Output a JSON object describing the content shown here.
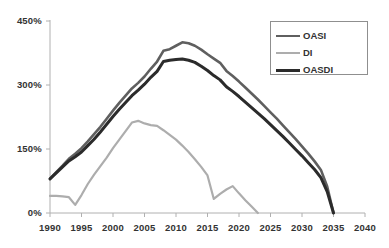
{
  "chart_data": {
    "type": "line",
    "title": "",
    "subtitle": "",
    "xlabel": "",
    "ylabel": "",
    "xlim": [
      1990,
      2040
    ],
    "ylim": [
      0,
      450
    ],
    "grid": false,
    "legend_position": "top-right",
    "y_ticks": [
      "0%",
      "150%",
      "300%",
      "450%"
    ],
    "y_tick_values": [
      0,
      150,
      300,
      450
    ],
    "x_ticks": [
      "1990",
      "1995",
      "2000",
      "2005",
      "2010",
      "2015",
      "2020",
      "2025",
      "2030",
      "2035",
      "2040"
    ],
    "x_tick_values": [
      1990,
      1995,
      2000,
      2005,
      2010,
      2015,
      2020,
      2025,
      2030,
      2035,
      2040
    ],
    "series": [
      {
        "name": "OASI",
        "color": "#5f5f5f",
        "width": 2.6,
        "x": [
          1990,
          1991,
          1992,
          1993,
          1994,
          1995,
          1996,
          1997,
          1998,
          1999,
          2000,
          2001,
          2002,
          2003,
          2004,
          2005,
          2006,
          2007,
          2008,
          2009,
          2010,
          2011,
          2012,
          2013,
          2014,
          2015,
          2016,
          2017,
          2018,
          2019,
          2020,
          2021,
          2022,
          2023,
          2024,
          2025,
          2026,
          2027,
          2028,
          2029,
          2030,
          2031,
          2032,
          2033,
          2034,
          2035
        ],
        "y": [
          80,
          96,
          111,
          127,
          139,
          152,
          168,
          185,
          202,
          221,
          240,
          258,
          275,
          292,
          305,
          320,
          338,
          355,
          380,
          384,
          392,
          400,
          398,
          392,
          383,
          372,
          362,
          352,
          333,
          321,
          308,
          294,
          280,
          266,
          251,
          236,
          221,
          205,
          189,
          173,
          156,
          139,
          121,
          101,
          62,
          0
        ]
      },
      {
        "name": "DI",
        "color": "#adadad",
        "width": 2.2,
        "x": [
          1990,
          1991,
          1992,
          1993,
          1994,
          1995,
          1996,
          1997,
          1998,
          1999,
          2000,
          2001,
          2002,
          2003,
          2004,
          2005,
          2006,
          2007,
          2008,
          2009,
          2010,
          2011,
          2012,
          2013,
          2014,
          2015,
          2016,
          2017,
          2018,
          2019,
          2020,
          2021,
          2022,
          2023
        ],
        "y": [
          40,
          40,
          39,
          37,
          19,
          42,
          68,
          90,
          110,
          130,
          152,
          172,
          192,
          212,
          216,
          210,
          206,
          204,
          194,
          183,
          172,
          158,
          143,
          126,
          108,
          88,
          33,
          45,
          55,
          63,
          46,
          30,
          15,
          0
        ]
      },
      {
        "name": "OASDI",
        "color": "#2b2b2b",
        "width": 3.0,
        "x": [
          1990,
          1991,
          1992,
          1993,
          1994,
          1995,
          1996,
          1997,
          1998,
          1999,
          2000,
          2001,
          2002,
          2003,
          2004,
          2005,
          2006,
          2007,
          2008,
          2009,
          2010,
          2011,
          2012,
          2013,
          2014,
          2015,
          2016,
          2017,
          2018,
          2019,
          2020,
          2021,
          2022,
          2023,
          2024,
          2025,
          2026,
          2027,
          2028,
          2029,
          2030,
          2031,
          2032,
          2033,
          2034,
          2035
        ],
        "y": [
          80,
          94,
          108,
          122,
          132,
          143,
          158,
          173,
          190,
          208,
          226,
          243,
          259,
          275,
          288,
          302,
          318,
          332,
          355,
          358,
          360,
          361,
          358,
          353,
          344,
          334,
          322,
          312,
          296,
          285,
          273,
          260,
          247,
          234,
          221,
          207,
          193,
          179,
          164,
          149,
          134,
          118,
          102,
          83,
          50,
          0
        ]
      }
    ]
  },
  "legend": {
    "items": [
      {
        "label": "OASI"
      },
      {
        "label": "DI"
      },
      {
        "label": "OASDI"
      }
    ]
  },
  "axis": {
    "y_labels": [
      "450%",
      "300%",
      "150%",
      "0%"
    ],
    "x_labels": [
      "1990",
      "1995",
      "2000",
      "2005",
      "2010",
      "2015",
      "2020",
      "2025",
      "2030",
      "2035",
      "2040"
    ]
  }
}
